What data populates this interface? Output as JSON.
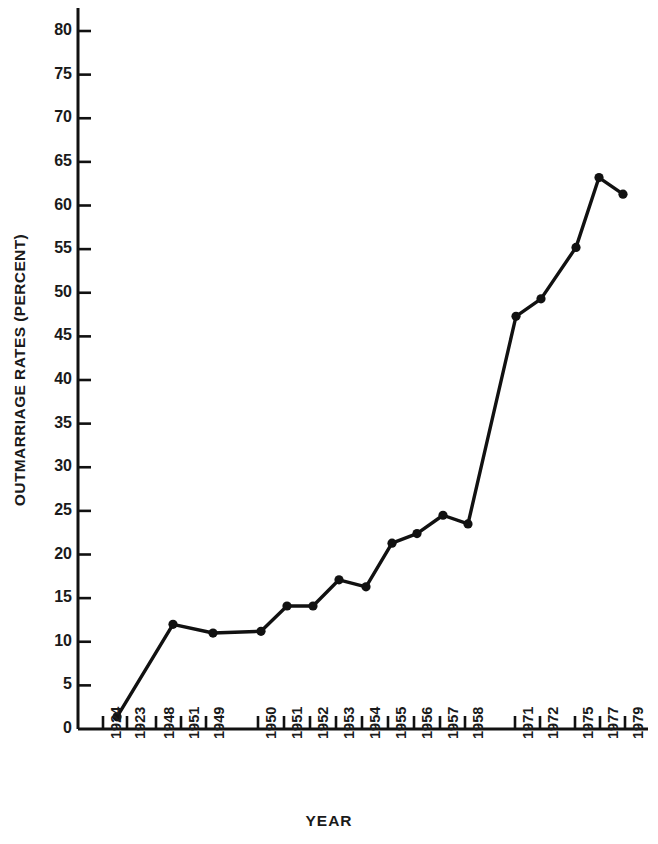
{
  "chart_data": {
    "type": "line",
    "title": "",
    "xlabel": "YEAR",
    "ylabel": "OUTMARRIAGE RATES (PERCENT)",
    "ylim": [
      0,
      80
    ],
    "ytick_values": [
      0,
      5,
      10,
      15,
      20,
      25,
      30,
      35,
      40,
      45,
      50,
      55,
      60,
      65,
      70,
      75,
      80
    ],
    "ytick_labels": [
      "0",
      "5",
      "10",
      "15",
      "20",
      "25",
      "30",
      "35",
      "40",
      "45",
      "50",
      "55",
      "60",
      "65",
      "70",
      "75",
      "80"
    ],
    "grid": false,
    "legend": null,
    "categories": [
      "1924",
      "1923",
      "1948",
      "1951",
      "1949",
      "1950",
      "1951",
      "1952",
      "1953",
      "1954",
      "1955",
      "1956",
      "1957",
      "1958",
      "1971",
      "1972",
      "1975",
      "1977",
      "1979"
    ],
    "xtick_labels": [
      "1924",
      "1923",
      "1948",
      "1951",
      "1949",
      "1950",
      "1951",
      "1952",
      "1953",
      "1954",
      "1955",
      "1956",
      "1957",
      "1958",
      "1971",
      "1972",
      "1975",
      "1977",
      "1979"
    ],
    "values": [
      null,
      1.4,
      12.0,
      11.0,
      null,
      11.2,
      14.1,
      14.1,
      17.1,
      16.3,
      21.3,
      22.4,
      24.5,
      23.5,
      47.3,
      49.3,
      55.2,
      63.2,
      61.3
    ],
    "series": [
      {
        "name": "Outmarriage rate",
        "points": [
          {
            "label": "1923",
            "value": 1.4
          },
          {
            "label": "1948",
            "value": 12.0
          },
          {
            "label": "1951",
            "value": 11.0
          },
          {
            "label": "1950",
            "value": 11.2
          },
          {
            "label": "1951",
            "value": 14.1
          },
          {
            "label": "1952",
            "value": 14.1
          },
          {
            "label": "1953",
            "value": 17.1
          },
          {
            "label": "1954",
            "value": 16.3
          },
          {
            "label": "1955",
            "value": 21.3
          },
          {
            "label": "1956",
            "value": 22.4
          },
          {
            "label": "1957",
            "value": 24.5
          },
          {
            "label": "1958",
            "value": 23.5
          },
          {
            "label": "1971",
            "value": 47.3
          },
          {
            "label": "1972",
            "value": 49.3
          },
          {
            "label": "1975",
            "value": 55.2
          },
          {
            "label": "1977",
            "value": 63.2
          },
          {
            "label": "1979",
            "value": 61.3
          }
        ]
      }
    ],
    "marker_color": "#111111",
    "line_color": "#111111",
    "axis_color": "#111111",
    "background_color": "#ffffff"
  },
  "axis": {
    "ylabel": "OUTMARRIAGE RATES (PERCENT)",
    "xlabel": "YEAR"
  }
}
